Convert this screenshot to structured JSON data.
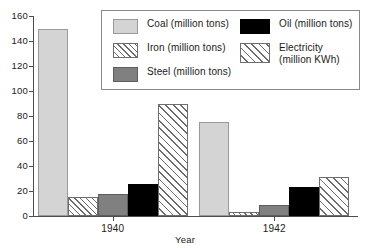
{
  "chart_data": {
    "type": "bar",
    "title": "",
    "xlabel": "Year",
    "ylabel": "",
    "categories": [
      "1940",
      "1942"
    ],
    "ylim": [
      0,
      160
    ],
    "yticks": [
      0,
      20,
      40,
      60,
      80,
      100,
      120,
      140,
      160
    ],
    "grid": false,
    "legend_position": "top-right-inside",
    "series": [
      {
        "name": "Coal (million tons)",
        "short": "Coal",
        "pattern": "solid-light-gray",
        "color": "#d4d4d4",
        "values": [
          150,
          75
        ]
      },
      {
        "name": "Iron (million tons)",
        "short": "Iron",
        "pattern": "diagonal-hatch",
        "color": "#ffffff",
        "values": [
          15,
          3
        ]
      },
      {
        "name": "Steel (million tons)",
        "short": "Steel",
        "pattern": "solid-mid-gray",
        "color": "#808080",
        "values": [
          18,
          9
        ]
      },
      {
        "name": "Oil (million tons)",
        "short": "Oil",
        "pattern": "solid-black",
        "color": "#000000",
        "values": [
          26,
          23
        ]
      },
      {
        "name": "Electricity (million KWh)",
        "short": "Electricity",
        "pattern": "cross-hatch",
        "color": "#ffffff",
        "values": [
          90,
          31
        ]
      }
    ]
  },
  "axis": {
    "y_tick_labels": [
      "0",
      "20",
      "40",
      "60",
      "80",
      "100",
      "120",
      "140",
      "160"
    ],
    "x_tick_labels": [
      "1940",
      "1942"
    ],
    "x_title": "Year"
  },
  "legend": {
    "left_column": [
      {
        "label": "Coal (million tons)",
        "swatch": "coal"
      },
      {
        "label": "Iron (million tons)",
        "swatch": "iron"
      },
      {
        "label": "Steel (million tons)",
        "swatch": "steel"
      }
    ],
    "right_column": [
      {
        "label": "Oil (million tons)",
        "swatch": "oil"
      },
      {
        "label": "Electricity\n(million KWh)",
        "swatch": "electricity"
      }
    ]
  },
  "colors": {
    "coal": "#d4d4d4",
    "steel": "#808080",
    "oil": "#000000",
    "hatch_stroke": "#6b6b6b",
    "axis": "#4d4d4d",
    "text": "#1a1a1a",
    "legend_border": "#8a8a8a",
    "background": "#ffffff"
  }
}
